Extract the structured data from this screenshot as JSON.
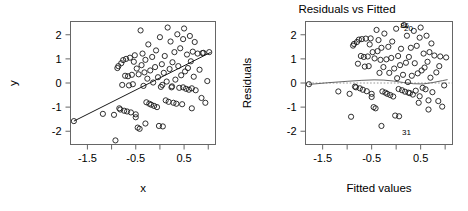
{
  "figure": {
    "type": "multi-panel-scatter",
    "background": "#ffffff",
    "point_color": "#1a1a1a",
    "line_color": "#1a1a1a",
    "axis_color": "#666666"
  },
  "panels": [
    {
      "id": "scatter-xy",
      "title": "",
      "xlabel": "x",
      "ylabel": "y"
    },
    {
      "id": "residuals-vs-fitted",
      "title": "Residuals vs Fitted",
      "xlabel": "Fitted values",
      "ylabel": "Residuals"
    }
  ],
  "chart_data": [
    {
      "type": "scatter",
      "id": "scatter-xy",
      "title": "",
      "xlabel": "x",
      "ylabel": "y",
      "xlim": [
        -1.85,
        1.15
      ],
      "ylim": [
        -2.55,
        2.55
      ],
      "xticks": [
        -1.5,
        -1.0,
        -0.5,
        0.0,
        0.5,
        1.0
      ],
      "xtick_labels": [
        "-1.5",
        "",
        "-0.5",
        "",
        "0.5",
        ""
      ],
      "yticks": [
        -2,
        -1,
        0,
        1,
        2
      ],
      "ytick_labels": [
        "-2",
        "-1",
        "0",
        "1",
        "2"
      ],
      "grid": false,
      "legend": false,
      "fit_line": {
        "type": "linear-regression",
        "x": [
          -1.78,
          1.05
        ],
        "y": [
          -1.58,
          1.27
        ],
        "slope": 1.007,
        "intercept": 0.21
      },
      "x": [
        -1.78,
        -1.18,
        -0.92,
        -0.88,
        -0.86,
        -0.84,
        -0.82,
        -0.8,
        -0.78,
        -0.76,
        -0.74,
        -0.72,
        -0.7,
        -0.68,
        -0.66,
        -0.64,
        -0.62,
        -0.6,
        -0.58,
        -0.56,
        -0.54,
        -0.52,
        -0.5,
        -0.5,
        -0.48,
        -0.46,
        -0.44,
        -0.42,
        -0.4,
        -0.38,
        -0.36,
        -0.34,
        -0.32,
        -0.3,
        -0.28,
        -0.26,
        -0.24,
        -0.22,
        -0.2,
        -0.18,
        -0.16,
        -0.14,
        -0.12,
        -0.1,
        -0.08,
        -0.06,
        -0.04,
        -0.02,
        0.0,
        0.02,
        0.04,
        0.06,
        0.08,
        0.1,
        0.12,
        0.14,
        0.16,
        0.18,
        0.2,
        0.22,
        0.24,
        0.26,
        0.28,
        0.3,
        0.32,
        0.34,
        0.36,
        0.38,
        0.4,
        0.42,
        0.44,
        0.46,
        0.48,
        0.5,
        0.52,
        0.54,
        0.56,
        0.58,
        0.6,
        0.62,
        0.64,
        0.66,
        0.68,
        0.7,
        0.72,
        0.74,
        0.78,
        0.82,
        0.86,
        0.9,
        0.94,
        0.98,
        1.02,
        -0.95,
        -0.3,
        0.05,
        0.25,
        0.48,
        0.66,
        0.88
      ],
      "y": [
        -1.58,
        -1.28,
        -2.38,
        0.62,
        0.7,
        -1.05,
        -1.1,
        0.82,
        -0.08,
        0.95,
        -1.15,
        0.3,
        1.0,
        -1.18,
        0.28,
        -0.1,
        1.05,
        -1.22,
        0.34,
        -0.05,
        0.88,
        1.15,
        -1.3,
        -1.42,
        0.6,
        -1.85,
        0.36,
        -1.9,
        2.18,
        0.74,
        1.22,
        -0.12,
        0.44,
        0.96,
        -0.8,
        0.18,
        1.6,
        -0.86,
        0.52,
        -0.9,
        1.08,
        0.02,
        -0.95,
        0.66,
        1.35,
        -1.0,
        0.24,
        -1.78,
        1.9,
        -0.16,
        0.78,
        -1.8,
        0.42,
        1.12,
        -0.72,
        0.06,
        2.3,
        -0.78,
        0.58,
        1.72,
        -0.18,
        0.86,
        -0.82,
        1.28,
        0.14,
        -0.86,
        2.02,
        0.7,
        -0.2,
        1.44,
        0.32,
        -0.88,
        1.82,
        2.26,
        0.48,
        -0.24,
        1.18,
        0.62,
        -0.28,
        1.95,
        0.9,
        -1.05,
        1.3,
        0.26,
        1.7,
        -0.3,
        1.22,
        0.55,
        -0.62,
        1.25,
        -0.82,
        0.08,
        1.28,
        -1.32,
        -1.68,
        -0.08,
        -0.14,
        -0.18,
        -0.22,
        1.24
      ]
    },
    {
      "type": "scatter",
      "id": "residuals-vs-fitted",
      "title": "Residuals vs Fitted",
      "xlabel": "Fitted values",
      "ylabel": "Residuals",
      "xlim": [
        -1.85,
        1.15
      ],
      "ylim": [
        -2.55,
        2.55
      ],
      "xticks": [
        -1.5,
        -1.0,
        -0.5,
        0.0,
        0.5,
        1.0
      ],
      "xtick_labels": [
        "-1.5",
        "",
        "-0.5",
        "",
        "0.5",
        ""
      ],
      "yticks": [
        -2,
        -1,
        0,
        1,
        2
      ],
      "ytick_labels": [
        "-2",
        "-1",
        "0",
        "1",
        "2"
      ],
      "grid": false,
      "legend": false,
      "zero_reference_line": {
        "y": 0,
        "style": "dotted"
      },
      "smoother": {
        "type": "lowess",
        "x": [
          -1.78,
          -1.4,
          -1.0,
          -0.7,
          -0.45,
          -0.25,
          -0.05,
          0.15,
          0.35,
          0.55,
          0.75,
          0.95,
          1.05
        ],
        "y": [
          -0.06,
          0.01,
          0.07,
          0.11,
          0.13,
          0.12,
          0.08,
          0.02,
          -0.03,
          -0.04,
          0.02,
          0.1,
          0.14
        ]
      },
      "point_labels": [
        {
          "text": "86",
          "x": 0.02,
          "y": 2.4
        },
        {
          "text": "20",
          "x": 0.1,
          "y": 2.26
        },
        {
          "text": "31",
          "x": 0.06,
          "y": -2.05
        }
      ],
      "x": [
        -1.78,
        -1.18,
        -0.92,
        -0.88,
        -0.86,
        -0.84,
        -0.82,
        -0.8,
        -0.78,
        -0.76,
        -0.74,
        -0.72,
        -0.7,
        -0.68,
        -0.66,
        -0.64,
        -0.62,
        -0.6,
        -0.58,
        -0.56,
        -0.54,
        -0.52,
        -0.5,
        -0.5,
        -0.48,
        -0.46,
        -0.44,
        -0.42,
        -0.4,
        -0.38,
        -0.36,
        -0.34,
        -0.32,
        -0.3,
        -0.28,
        -0.26,
        -0.24,
        -0.22,
        -0.2,
        -0.18,
        -0.16,
        -0.14,
        -0.12,
        -0.1,
        -0.08,
        -0.06,
        -0.04,
        -0.02,
        0.0,
        0.02,
        0.04,
        0.06,
        0.08,
        0.1,
        0.12,
        0.14,
        0.16,
        0.18,
        0.2,
        0.22,
        0.24,
        0.26,
        0.28,
        0.3,
        0.32,
        0.34,
        0.36,
        0.38,
        0.4,
        0.42,
        0.44,
        0.46,
        0.48,
        0.5,
        0.52,
        0.54,
        0.56,
        0.58,
        0.6,
        0.62,
        0.64,
        0.66,
        0.68,
        0.7,
        0.72,
        0.74,
        0.78,
        0.82,
        0.86,
        0.9,
        0.94,
        0.98,
        1.02,
        -0.95,
        -0.3,
        0.05,
        0.25,
        0.48,
        0.66,
        0.88
      ],
      "y": [
        -0.05,
        -0.35,
        -1.4,
        1.55,
        1.62,
        -0.15,
        -0.18,
        1.7,
        0.8,
        1.8,
        -0.22,
        1.12,
        1.82,
        -0.28,
        1.08,
        0.68,
        1.84,
        -0.34,
        1.1,
        0.7,
        1.6,
        1.85,
        -0.45,
        -0.58,
        1.28,
        -1.0,
        1.02,
        -1.05,
        2.2,
        1.32,
        1.78,
        0.42,
        0.96,
        1.46,
        -0.35,
        0.66,
        2.05,
        -0.4,
        0.98,
        -0.45,
        1.5,
        0.42,
        -0.5,
        1.04,
        1.72,
        -0.56,
        0.6,
        -1.35,
        2.25,
        0.2,
        1.12,
        -1.38,
        0.74,
        1.42,
        -0.3,
        0.34,
        2.4,
        -0.36,
        0.84,
        1.96,
        0.04,
        1.08,
        -0.42,
        1.46,
        0.3,
        -0.48,
        2.16,
        0.82,
        -0.32,
        1.54,
        0.4,
        -0.82,
        1.88,
        2.3,
        0.52,
        -0.2,
        1.22,
        0.64,
        -0.26,
        1.96,
        0.88,
        -1.1,
        1.28,
        0.22,
        1.64,
        -0.38,
        1.14,
        0.44,
        -0.75,
        1.1,
        -0.98,
        -0.1,
        1.06,
        -0.45,
        -1.78,
        -0.25,
        -0.4,
        -0.55,
        -0.72,
        0.7
      ]
    }
  ]
}
